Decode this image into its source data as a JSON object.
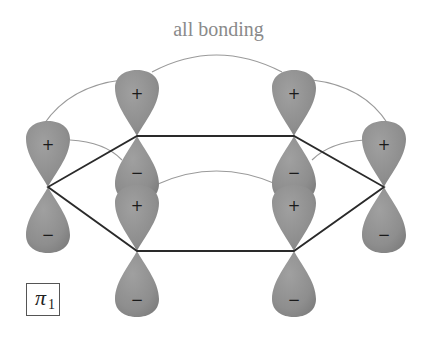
{
  "title": "all bonding",
  "label": {
    "symbol": "π",
    "subscript": "1"
  },
  "colors": {
    "lobe": "#8c8c8c",
    "lobe_highlight": "#a6a6a6",
    "ring": "#2a2a2a",
    "overlap_arc": "#9a9a9a",
    "title": "#8a8a8a"
  },
  "atoms": [
    {
      "id": "left",
      "top_sign": "+",
      "bottom_sign": "−"
    },
    {
      "id": "top-left",
      "top_sign": "+",
      "bottom_sign": "−"
    },
    {
      "id": "top-right",
      "top_sign": "+",
      "bottom_sign": "−"
    },
    {
      "id": "right",
      "top_sign": "+",
      "bottom_sign": "−"
    },
    {
      "id": "bottom-left",
      "top_sign": "+",
      "bottom_sign": "−"
    },
    {
      "id": "bottom-right",
      "top_sign": "+",
      "bottom_sign": "−"
    }
  ]
}
